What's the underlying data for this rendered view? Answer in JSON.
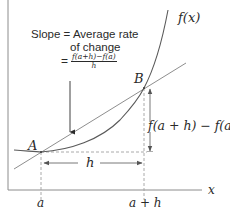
{
  "diagram": {
    "annotation": {
      "line1": "Slope = Average rate",
      "line2": "of change",
      "equals": "=",
      "fraction_numerator": "f(a+h)−f(a)",
      "fraction_denominator": "h"
    },
    "curve_label": "f(x)",
    "points": [
      {
        "name": "A",
        "label": "A"
      },
      {
        "name": "B",
        "label": "B"
      }
    ],
    "x_axis_label": "x",
    "x_ticks": [
      {
        "label": "a"
      },
      {
        "label": "a + h"
      }
    ],
    "horizontal_span_label": "h",
    "vertical_span_label": "f(a + h) − f(a)",
    "colors": {
      "curve": "#555555",
      "secant": "#8a8a8a",
      "axes": "#888888",
      "dashed": "#9a9a9a",
      "text": "#2a2a2a"
    }
  }
}
